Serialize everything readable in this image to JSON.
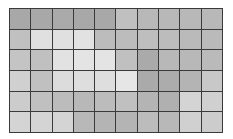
{
  "chart_data": {
    "type": "heatmap",
    "title": "",
    "xlabel": "",
    "ylabel": "",
    "rows": 6,
    "cols": 10,
    "colormap": "grayscale",
    "grid": true,
    "grid_color": "#3a3a3a",
    "values": [
      [
        168,
        168,
        170,
        168,
        168,
        192,
        184,
        184,
        184,
        184
      ],
      [
        192,
        224,
        224,
        226,
        188,
        188,
        190,
        188,
        186,
        186
      ],
      [
        196,
        192,
        226,
        228,
        228,
        192,
        170,
        184,
        184,
        186
      ],
      [
        208,
        192,
        220,
        222,
        222,
        230,
        170,
        172,
        180,
        200
      ],
      [
        204,
        192,
        188,
        184,
        188,
        192,
        180,
        176,
        212,
        208
      ],
      [
        212,
        212,
        212,
        184,
        180,
        180,
        188,
        184,
        208,
        204
      ]
    ]
  }
}
